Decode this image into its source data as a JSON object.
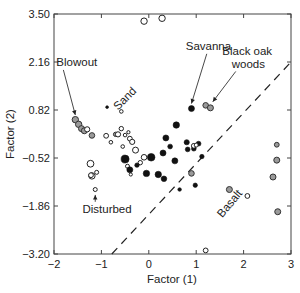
{
  "chart_data": {
    "type": "scatter",
    "title": "",
    "xlabel": "Factor (1)",
    "ylabel": "Factor (2)",
    "xlim": [
      -2,
      3
    ],
    "ylim": [
      -3.2,
      3.5
    ],
    "x_ticks": [
      -2,
      -1,
      0,
      1,
      2,
      3
    ],
    "x_tick_labels": [
      "−2",
      "−1",
      "0",
      "1",
      "2",
      "3"
    ],
    "y_ticks": [
      3.5,
      2.16,
      0.82,
      -0.52,
      -1.86,
      -3.2
    ],
    "y_tick_labels": [
      "3.50",
      "2.16",
      "0.82",
      "−0.52",
      "−1.86",
      "−3.20"
    ],
    "grid": false,
    "legend": null,
    "marker_styles": {
      "open": {
        "fill": "#ffffff",
        "stroke": "#222222"
      },
      "filled": {
        "fill": "#111111",
        "stroke": "#111111"
      },
      "gray": {
        "fill": "#9a9a9a",
        "stroke": "#333333"
      }
    },
    "series": [
      {
        "name": "Blowout",
        "style": "gray",
        "points": [
          {
            "x": -1.55,
            "y": 0.55,
            "r": 3.2
          },
          {
            "x": -1.48,
            "y": 0.42,
            "r": 3.2
          },
          {
            "x": -1.42,
            "y": 0.3,
            "r": 3.0
          },
          {
            "x": -1.36,
            "y": 0.24,
            "r": 3.0
          },
          {
            "x": -1.2,
            "y": 0.11,
            "r": 2.8
          },
          {
            "x": -0.7,
            "y": 0.14,
            "r": 2.2
          }
        ]
      },
      {
        "name": "Blowout (open)",
        "style": "open",
        "points": [
          {
            "x": -1.3,
            "y": 0.28,
            "r": 2.6
          },
          {
            "x": -0.9,
            "y": 0.1,
            "r": 2.4
          },
          {
            "x": -0.8,
            "y": -0.08,
            "r": 1.8
          },
          {
            "x": -0.65,
            "y": 0.14,
            "r": 2.6
          },
          {
            "x": -0.58,
            "y": 0.3,
            "r": 2.2
          },
          {
            "x": -0.5,
            "y": 0.12,
            "r": 1.8
          },
          {
            "x": -0.4,
            "y": 0.02,
            "r": 2.4
          }
        ]
      },
      {
        "name": "Sand",
        "style": "open",
        "points": [
          {
            "x": -0.58,
            "y": 0.78,
            "r": 1.8
          },
          {
            "x": -0.43,
            "y": 0.2,
            "r": 1.6
          },
          {
            "x": -0.35,
            "y": -0.07,
            "r": 2.6
          },
          {
            "x": -0.28,
            "y": -0.3,
            "r": 3.0
          },
          {
            "x": -0.55,
            "y": -0.2,
            "r": 1.8
          },
          {
            "x": -0.1,
            "y": -0.5,
            "r": 2.8
          },
          {
            "x": -0.18,
            "y": -0.65,
            "r": 2.2
          },
          {
            "x": -0.45,
            "y": -0.75,
            "r": 2.0
          },
          {
            "x": -0.38,
            "y": -0.98,
            "r": 1.6
          }
        ]
      },
      {
        "name": "Sand (filled)",
        "style": "filled",
        "points": [
          {
            "x": -0.88,
            "y": 0.9,
            "r": 1.4
          },
          {
            "x": -0.5,
            "y": -0.55,
            "r": 4.0
          },
          {
            "x": -0.4,
            "y": -0.85,
            "r": 3.0
          },
          {
            "x": -0.25,
            "y": -0.72,
            "r": 2.2
          },
          {
            "x": 0.05,
            "y": -0.5,
            "r": 3.8
          },
          {
            "x": -0.05,
            "y": -0.95,
            "r": 3.2
          },
          {
            "x": 0.2,
            "y": -0.98,
            "r": 3.2
          },
          {
            "x": 0.3,
            "y": -0.38,
            "r": 3.0
          },
          {
            "x": 0.32,
            "y": -1.1,
            "r": 2.8
          },
          {
            "x": 0.55,
            "y": -0.6,
            "r": 3.0
          }
        ]
      },
      {
        "name": "Savanna",
        "style": "filled",
        "points": [
          {
            "x": 0.9,
            "y": 0.86,
            "r": 3.0
          },
          {
            "x": 0.58,
            "y": 0.4,
            "r": 3.2
          },
          {
            "x": 0.36,
            "y": 0.04,
            "r": 3.0
          },
          {
            "x": 0.45,
            "y": -0.2,
            "r": 2.4
          },
          {
            "x": 0.8,
            "y": -0.08,
            "r": 2.6
          },
          {
            "x": 0.82,
            "y": -0.28,
            "r": 2.4
          },
          {
            "x": 0.95,
            "y": -0.26,
            "r": 2.4
          },
          {
            "x": 1.05,
            "y": -0.12,
            "r": 2.4
          },
          {
            "x": 1.12,
            "y": -0.48,
            "r": 2.2
          },
          {
            "x": 0.98,
            "y": -1.28,
            "r": 2.2
          },
          {
            "x": 0.65,
            "y": -1.4,
            "r": 1.8
          }
        ]
      },
      {
        "name": "Savanna (open)",
        "style": "open",
        "points": [
          {
            "x": 0.95,
            "y": -0.18,
            "r": 2.4
          },
          {
            "x": 1.0,
            "y": -0.16,
            "r": 2.0
          }
        ]
      },
      {
        "name": "Savanna (gray)",
        "style": "gray",
        "points": [
          {
            "x": 0.9,
            "y": -0.95,
            "r": 2.8
          }
        ]
      },
      {
        "name": "Black oak woods",
        "style": "gray",
        "points": [
          {
            "x": 1.2,
            "y": 0.95,
            "r": 2.8
          },
          {
            "x": 1.3,
            "y": 0.88,
            "r": 3.0
          }
        ]
      },
      {
        "name": "Disturbed",
        "style": "open",
        "points": [
          {
            "x": -1.23,
            "y": -0.68,
            "r": 3.4
          },
          {
            "x": -1.1,
            "y": -0.92,
            "r": 2.0
          },
          {
            "x": -1.2,
            "y": -1.02,
            "r": 3.2
          },
          {
            "x": -1.22,
            "y": -1.0,
            "r": 2.4
          },
          {
            "x": -1.13,
            "y": -1.4,
            "r": 2.0
          }
        ]
      },
      {
        "name": "Outliers (top)",
        "style": "open",
        "points": [
          {
            "x": -0.1,
            "y": 3.3,
            "r": 3.2
          },
          {
            "x": 0.28,
            "y": 3.38,
            "r": 3.2
          }
        ]
      },
      {
        "name": "Basalt",
        "style": "gray",
        "points": [
          {
            "x": 2.7,
            "y": -0.15,
            "r": 2.4
          },
          {
            "x": 2.62,
            "y": -1.05,
            "r": 3.0
          },
          {
            "x": 2.7,
            "y": -0.58,
            "r": 3.0
          },
          {
            "x": 1.7,
            "y": -1.4,
            "r": 3.0
          },
          {
            "x": 2.72,
            "y": -2.02,
            "r": 3.0
          }
        ]
      },
      {
        "name": "Basalt (open)",
        "style": "open",
        "points": [
          {
            "x": 2.08,
            "y": -1.58,
            "r": 2.4
          },
          {
            "x": 1.2,
            "y": -3.1,
            "r": 2.4
          }
        ]
      }
    ],
    "divider_line": {
      "style": "dashed",
      "from": [
        -0.78,
        -3.2
      ],
      "to": [
        3.0,
        2.16
      ]
    },
    "annotations": [
      {
        "text": "Blowout",
        "x": -1.95,
        "y": 2.05,
        "arrow_to": [
          -1.55,
          0.68
        ]
      },
      {
        "text": "Sand",
        "x": -0.65,
        "y": 0.8,
        "rotation": -45
      },
      {
        "text": "Savanna",
        "x": 0.78,
        "y": 2.5,
        "arrow_to": [
          0.9,
          1.0
        ]
      },
      {
        "text": "Black oak",
        "x": 1.55,
        "y": 2.36
      },
      {
        "text": "woods",
        "x": 1.75,
        "y": 1.98,
        "arrow_to": [
          1.35,
          1.05
        ]
      },
      {
        "text": "Disturbed",
        "x": -1.4,
        "y": -2.05,
        "arrow_to": [
          -1.13,
          -1.55
        ]
      },
      {
        "text": "Basalt",
        "x": 1.55,
        "y": -2.2,
        "rotation": -50
      }
    ]
  }
}
